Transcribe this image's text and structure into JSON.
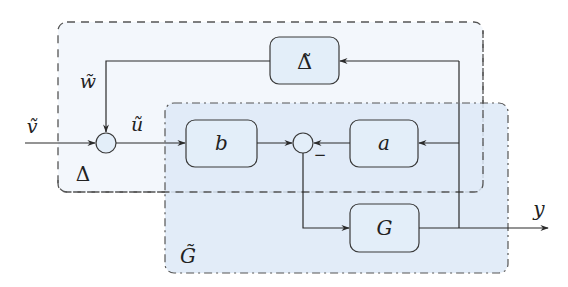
{
  "diagram": {
    "colors": {
      "line": "#2b2b2b",
      "outer_box_fill": "#f3f7fc",
      "inner_box_fill": "#dde9f7",
      "block_fill": "#e3eef9",
      "block_stroke": "#3a3a3a",
      "circle_fill": "#e3eef9"
    },
    "groups": [
      {
        "id": "delta-group",
        "label": "Δ",
        "border": "dashed"
      },
      {
        "id": "g-tilde-group",
        "label": "G̃",
        "border": "dash-dot"
      }
    ],
    "blocks": [
      {
        "id": "delta-tilde",
        "label": "Δ̃"
      },
      {
        "id": "b",
        "label": "b"
      },
      {
        "id": "a",
        "label": "a"
      },
      {
        "id": "G",
        "label": "G"
      }
    ],
    "sum_junctions": [
      {
        "id": "sum1",
        "sign_label": ""
      },
      {
        "id": "sum2",
        "sign_label": "−"
      }
    ],
    "signals": {
      "v_tilde": "ṽ",
      "w_tilde": "w̃",
      "u_tilde": "ũ",
      "y": "y"
    }
  }
}
